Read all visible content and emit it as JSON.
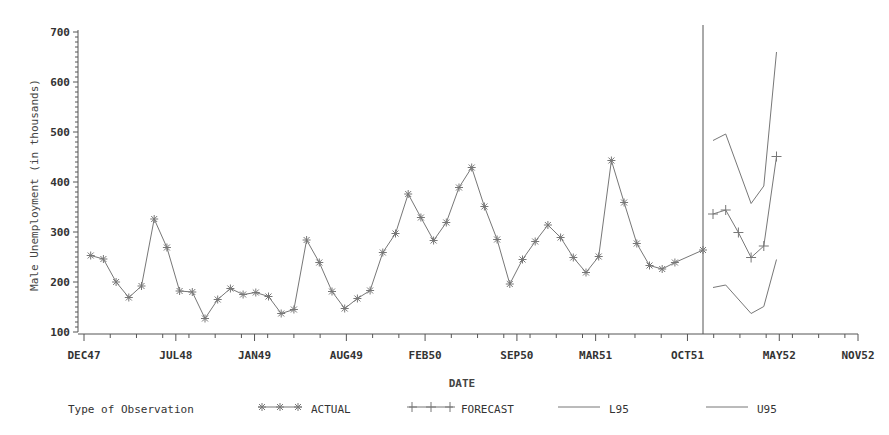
{
  "chart_data": {
    "type": "line",
    "title": "",
    "xlabel": "DATE",
    "ylabel": "Male Unemployment (in thousands)",
    "ylim": [
      100,
      700
    ],
    "yticks": [
      100,
      200,
      300,
      400,
      500,
      600,
      700
    ],
    "xtick_labels": [
      "DEC47",
      "JUL48",
      "JAN49",
      "AUG49",
      "FEB50",
      "SEP50",
      "MAR51",
      "OCT51",
      "MAY52",
      "NOV52"
    ],
    "grid": false,
    "legend_position": "bottom",
    "legend_title": "Type of Observation",
    "forecast_start_marker": "DEC51",
    "series": [
      {
        "name": "ACTUAL",
        "marker": "star",
        "start_month_index": 1,
        "values": [
          253,
          246,
          200,
          169,
          192,
          326,
          269,
          182,
          180,
          127,
          165,
          187,
          175,
          179,
          171,
          137,
          145,
          284,
          239,
          181,
          147,
          167,
          183,
          259,
          297,
          376,
          329,
          283,
          319,
          389,
          429,
          351,
          285,
          196,
          245,
          281,
          314,
          289,
          249,
          219,
          251,
          443,
          359,
          277,
          233,
          226,
          239,
          264
        ]
      },
      {
        "name": "FORECAST",
        "marker": "plus",
        "start_month_index": 50,
        "values": [
          336,
          344,
          299,
          249,
          272,
          451
        ]
      },
      {
        "name": "L95",
        "marker": "none",
        "start_month_index": 50,
        "values": [
          189,
          194,
          null,
          137,
          151,
          245
        ]
      },
      {
        "name": "U95",
        "marker": "none",
        "start_month_index": 50,
        "values": [
          483,
          496,
          null,
          357,
          392,
          660
        ]
      }
    ]
  },
  "labels": {
    "ylabel": "Male Unemployment (in thousands)",
    "xlabel": "DATE",
    "legend_title": "Type of Observation",
    "legend_actual": "ACTUAL",
    "legend_forecast": "FORECAST",
    "legend_l95": "L95",
    "legend_u95": "U95"
  },
  "colors": {
    "line": "#777777",
    "axis": "#555555",
    "text": "#333333"
  }
}
